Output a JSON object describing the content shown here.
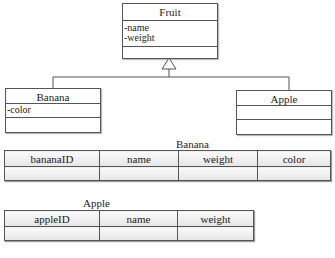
{
  "uml": {
    "fruit": {
      "name": "Fruit",
      "attributes": [
        "-name",
        "-weight"
      ],
      "methods": []
    },
    "banana": {
      "name": "Banana",
      "attributes": [
        "-color"
      ],
      "methods": []
    },
    "apple": {
      "name": "Apple",
      "attributes": [],
      "methods": []
    },
    "relationship": "generalization"
  },
  "tables": {
    "banana": {
      "label": "Banana",
      "columns": [
        "bananaID",
        "name",
        "weight",
        "color"
      ],
      "rows": [
        [
          "",
          "",
          "",
          ""
        ]
      ]
    },
    "apple": {
      "label": "Apple",
      "columns": [
        "appleID",
        "name",
        "weight"
      ],
      "rows": [
        [
          "",
          "",
          ""
        ]
      ]
    }
  },
  "colors": {
    "line": "#555555",
    "cell_fill_top": "#fafafa",
    "cell_fill_bottom": "#e6e6e6"
  }
}
